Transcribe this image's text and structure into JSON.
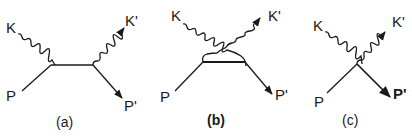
{
  "figure": {
    "stroke_color": "#1a1a1a",
    "background": "#ffffff",
    "diagrams": [
      {
        "id": "a",
        "caption": "(a)",
        "labels": {
          "k_in": "K",
          "k_out": "K'",
          "p_in": "P",
          "p_out": "P'"
        }
      },
      {
        "id": "b",
        "caption": "(b)",
        "labels": {
          "k_in": "K",
          "k_out": "K'",
          "p_in": "P",
          "p_out": "P'"
        }
      },
      {
        "id": "c",
        "caption": "(c)",
        "labels": {
          "k_in": "K",
          "k_out": "K'",
          "p_in": "P",
          "p_out": "P'"
        }
      }
    ]
  }
}
